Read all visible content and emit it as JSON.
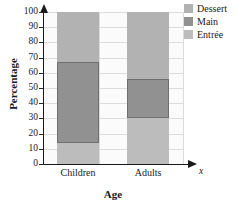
{
  "chart_data": {
    "type": "bar",
    "subtype": "stacked-bar-100-percent",
    "title": "",
    "xlabel": "Age",
    "ylabel": "Percentage",
    "x_axis_variable": "x",
    "categories": [
      "Children",
      "Adults"
    ],
    "ylim": [
      0,
      100
    ],
    "yticks": [
      0,
      10,
      20,
      30,
      40,
      50,
      60,
      70,
      80,
      90,
      100
    ],
    "ytick_labels": [
      "0",
      "10",
      "20",
      "30",
      "40",
      "50",
      "60",
      "70",
      "80",
      "90",
      "100"
    ],
    "grid": true,
    "legend_position": "right-top",
    "series": [
      {
        "name": "Dessert",
        "color": "#b2b2b2",
        "values": [
          33,
          44
        ],
        "cumulative_top": [
          100,
          100
        ],
        "cumulative_bottom": [
          67,
          56
        ]
      },
      {
        "name": "Main",
        "color": "#919191",
        "values": [
          53,
          26
        ],
        "cumulative_top": [
          67,
          56
        ],
        "cumulative_bottom": [
          14,
          30
        ]
      },
      {
        "name": "Entrée",
        "color": "#bcbcbc",
        "values": [
          14,
          30
        ],
        "cumulative_top": [
          14,
          30
        ],
        "cumulative_bottom": [
          0,
          0
        ]
      }
    ],
    "legend": [
      {
        "label": "Dessert",
        "color": "#b2b2b2"
      },
      {
        "label": "Main",
        "color": "#919191"
      },
      {
        "label": "Entrée",
        "color": "#bcbcbc"
      }
    ]
  }
}
